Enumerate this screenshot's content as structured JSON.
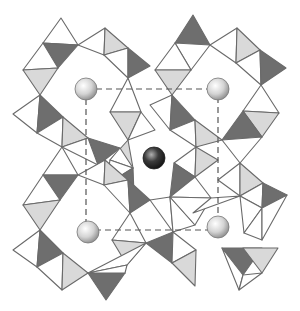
{
  "diagram": {
    "colors": {
      "background": "#ffffff",
      "edge": "#6a6a6a",
      "white_face": "#ffffff",
      "light_face": "#d9d9d9",
      "dark_face": "#6e6e6e",
      "dashed_line": "#555555",
      "sphere_light": "#d8d8d8",
      "sphere_dark": "#3a3a3a"
    },
    "unit_cell": {
      "x1": 86,
      "y1": 89,
      "x2": 218,
      "y2": 230
    },
    "spheres": [
      {
        "id": "top-left",
        "cx": 86,
        "cy": 89,
        "r": 11,
        "shade": "light"
      },
      {
        "id": "top-right",
        "cx": 218,
        "cy": 89,
        "r": 11,
        "shade": "light"
      },
      {
        "id": "center",
        "cx": 154,
        "cy": 158,
        "r": 11,
        "shade": "dark"
      },
      {
        "id": "bottom-left",
        "cx": 88,
        "cy": 232,
        "r": 11,
        "shade": "light"
      },
      {
        "id": "bottom-right",
        "cx": 218,
        "cy": 227,
        "r": 11,
        "shade": "light"
      }
    ],
    "triangles": [
      {
        "pts": "61,18 43,43 78,45",
        "fill": "white"
      },
      {
        "pts": "43,43 78,45 58,68",
        "fill": "dark"
      },
      {
        "pts": "43,43 23,70 58,68",
        "fill": "white"
      },
      {
        "pts": "23,70 58,68 40,95",
        "fill": "light"
      },
      {
        "pts": "78,45 105,28 104,55",
        "fill": "white"
      },
      {
        "pts": "105,28 104,55 128,48",
        "fill": "light"
      },
      {
        "pts": "104,55 128,48 128,78",
        "fill": "white"
      },
      {
        "pts": "128,48 128,78 150,66",
        "fill": "dark"
      },
      {
        "pts": "40,95 13,114 37,133",
        "fill": "white"
      },
      {
        "pts": "40,95 37,133 63,117",
        "fill": "dark"
      },
      {
        "pts": "37,133 63,117 62,147",
        "fill": "white"
      },
      {
        "pts": "63,117 62,147 88,138",
        "fill": "light"
      },
      {
        "pts": "128,78 110,112 141,112",
        "fill": "white"
      },
      {
        "pts": "110,112 141,112 128,140",
        "fill": "light"
      },
      {
        "pts": "141,112 128,140 155,130",
        "fill": "white"
      },
      {
        "pts": "88,138 98,165 120,148",
        "fill": "dark"
      },
      {
        "pts": "88,138 62,147 98,165",
        "fill": "white"
      },
      {
        "pts": "193,15 175,43 210,45",
        "fill": "dark"
      },
      {
        "pts": "175,43 210,45 191,70",
        "fill": "white"
      },
      {
        "pts": "175,43 155,70 191,70",
        "fill": "white"
      },
      {
        "pts": "155,70 191,70 172,95",
        "fill": "light"
      },
      {
        "pts": "210,45 237,28 236,63",
        "fill": "white"
      },
      {
        "pts": "237,28 236,63 260,50",
        "fill": "light"
      },
      {
        "pts": "236,63 260,50 261,85",
        "fill": "white"
      },
      {
        "pts": "260,50 261,85 286,68",
        "fill": "dark"
      },
      {
        "pts": "172,95 150,105 170,130",
        "fill": "white"
      },
      {
        "pts": "172,95 170,130 195,120",
        "fill": "dark"
      },
      {
        "pts": "170,130 195,120 196,147",
        "fill": "white"
      },
      {
        "pts": "195,120 196,147 222,140",
        "fill": "light"
      },
      {
        "pts": "261,85 243,111 279,113",
        "fill": "white"
      },
      {
        "pts": "243,111 279,113 262,137",
        "fill": "light"
      },
      {
        "pts": "243,111 262,137 222,140",
        "fill": "dark"
      },
      {
        "pts": "222,140 262,137 240,163",
        "fill": "white"
      },
      {
        "pts": "240,163 218,180 240,196",
        "fill": "white"
      },
      {
        "pts": "240,163 240,196 263,183",
        "fill": "light"
      },
      {
        "pts": "240,196 263,183 262,208",
        "fill": "white"
      },
      {
        "pts": "263,183 262,208 287,195",
        "fill": "dark"
      },
      {
        "pts": "196,147 174,163 195,177",
        "fill": "white"
      },
      {
        "pts": "196,147 195,177 218,160",
        "fill": "light"
      },
      {
        "pts": "174,163 195,177 170,197",
        "fill": "dark"
      },
      {
        "pts": "195,177 170,197 211,198",
        "fill": "white"
      },
      {
        "pts": "128,140 110,160 133,168",
        "fill": "light"
      },
      {
        "pts": "110,160 133,168 120,148",
        "fill": "white"
      },
      {
        "pts": "133,168 110,160 106,185",
        "fill": "white"
      },
      {
        "pts": "133,168 106,185 134,195",
        "fill": "dark"
      },
      {
        "pts": "62,147 43,175 78,175",
        "fill": "white"
      },
      {
        "pts": "43,175 78,175 60,200",
        "fill": "dark"
      },
      {
        "pts": "43,175 23,205 60,200",
        "fill": "white"
      },
      {
        "pts": "23,205 60,200 40,230",
        "fill": "light"
      },
      {
        "pts": "78,175 105,160 104,185",
        "fill": "white"
      },
      {
        "pts": "105,160 104,185 128,180",
        "fill": "light"
      },
      {
        "pts": "104,185 128,180 130,213",
        "fill": "white"
      },
      {
        "pts": "128,180 130,213 150,200",
        "fill": "dark"
      },
      {
        "pts": "40,230 13,250 37,267",
        "fill": "white"
      },
      {
        "pts": "40,230 37,267 63,253",
        "fill": "dark"
      },
      {
        "pts": "37,267 63,253 62,290",
        "fill": "white"
      },
      {
        "pts": "63,253 62,290 88,273",
        "fill": "light"
      },
      {
        "pts": "88,273 90,273 125,273",
        "fill": "white"
      },
      {
        "pts": "88,273 125,273 106,300",
        "fill": "dark"
      },
      {
        "pts": "130,213 112,240 146,243",
        "fill": "white"
      },
      {
        "pts": "112,240 146,243 127,265",
        "fill": "light"
      },
      {
        "pts": "146,243 127,265 88,273",
        "fill": "white"
      },
      {
        "pts": "127,265 88,273 125,273",
        "fill": "white"
      },
      {
        "pts": "150,200 170,197 173,232",
        "fill": "white"
      },
      {
        "pts": "173,232 195,225 170,197",
        "fill": "white"
      },
      {
        "pts": "170,197 211,198 195,225",
        "fill": "white"
      },
      {
        "pts": "146,243 173,232 172,263",
        "fill": "dark"
      },
      {
        "pts": "173,232 172,263 196,250",
        "fill": "white"
      },
      {
        "pts": "172,263 196,250 195,286",
        "fill": "light"
      },
      {
        "pts": "211,198 193,213 240,196",
        "fill": "white"
      },
      {
        "pts": "240,196 262,208 244,233",
        "fill": "white"
      },
      {
        "pts": "244,233 262,208 262,240",
        "fill": "white"
      },
      {
        "pts": "262,208 287,195 262,240",
        "fill": "white"
      },
      {
        "pts": "222,248 262,248 243,275",
        "fill": "dark"
      },
      {
        "pts": "243,248 278,248 262,273",
        "fill": "light"
      },
      {
        "pts": "222,248 243,275 239,290",
        "fill": "white"
      },
      {
        "pts": "243,275 262,273 239,290",
        "fill": "white"
      }
    ],
    "outlines": [
      "61,18 23,70 40,95 13,114 37,133 62,147 88,138 120,148 128,140 155,130 150,105 172,95 155,70 175,43 193,15",
      "105,28 150,66 172,95",
      "237,28 286,68 261,85 279,113 262,137 240,163 287,195 262,240",
      "13,250 62,290 88,273 106,300 125,273 172,263 195,286 222,248 239,290 278,248 262,240"
    ]
  }
}
